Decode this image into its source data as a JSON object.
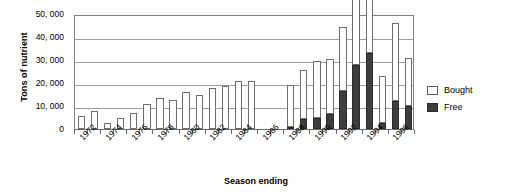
{
  "chart_data": {
    "type": "bar",
    "subtype": "stacked",
    "title": "",
    "xlabel": "Season ending",
    "ylabel": "Tons of nutrient",
    "ylim": [
      0,
      50000
    ],
    "ytick_values": [
      50000,
      40000,
      30000,
      20000,
      10000,
      0
    ],
    "ytick_labels": [
      "50, 000",
      "40, 000",
      "30, 000",
      "20, 000",
      "10, 000",
      "0"
    ],
    "grid": true,
    "legend_position": "right",
    "categories": [
      "1972",
      "1973",
      "1974",
      "1975",
      "1976",
      "1977",
      "1978",
      "1979",
      "1980",
      "1981",
      "1982",
      "1983",
      "1984",
      "1985",
      "1986",
      "1987",
      "1988",
      "1989",
      "1990",
      "1991",
      "1992",
      "1993",
      "1994",
      "1995",
      "1996",
      "1997"
    ],
    "xtick_labels": [
      "1972",
      "1974",
      "1976",
      "1978",
      "1980",
      "1982",
      "1984",
      "1986",
      "1988",
      "1990",
      "1992",
      "1994",
      "1996"
    ],
    "series": [
      {
        "name": "Bought",
        "color": "#ffffff",
        "values": [
          5500,
          7800,
          2800,
          5000,
          7000,
          11000,
          13500,
          12500,
          16000,
          15000,
          18000,
          18500,
          21000,
          21000,
          null,
          null,
          18000,
          21000,
          24500,
          24000,
          28000,
          37500,
          40000,
          20500,
          34000,
          21000
        ]
      },
      {
        "name": "Free",
        "color": "#3d3d3d",
        "values": [
          0,
          0,
          0,
          0,
          0,
          0,
          0,
          0,
          0,
          0,
          0,
          0,
          0,
          0,
          null,
          null,
          1000,
          4500,
          5000,
          6500,
          16500,
          28000,
          33000,
          2500,
          12000,
          10000
        ]
      }
    ]
  },
  "legend": {
    "items": [
      {
        "label": "Bought",
        "swatch": "bought"
      },
      {
        "label": "Free",
        "swatch": "free"
      }
    ]
  }
}
